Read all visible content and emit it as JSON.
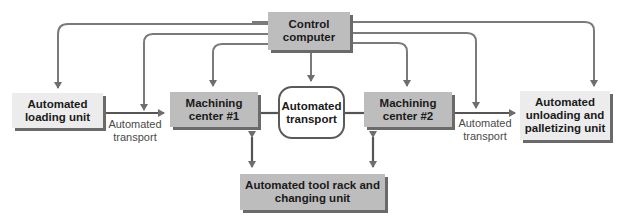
{
  "diagram": {
    "nodes": {
      "control": {
        "line1": "Control",
        "line2": "computer"
      },
      "loading": {
        "line1": "Automated",
        "line2": "loading unit"
      },
      "mc1": {
        "line1": "Machining",
        "line2": "center #1"
      },
      "transport_loop": {
        "line1": "Automated",
        "line2": "transport"
      },
      "mc2": {
        "line1": "Machining",
        "line2": "center #2"
      },
      "unloading": {
        "line1": "Automated",
        "line2": "unloading and",
        "line3": "palletizing unit"
      },
      "toolrack": {
        "line1": "Automated tool rack and",
        "line2": "changing unit"
      }
    },
    "edge_labels": {
      "left_transport": {
        "line1": "Automated",
        "line2": "transport"
      },
      "right_transport": {
        "line1": "Automated",
        "line2": "transport"
      }
    },
    "colors": {
      "line": "#6e6e6e",
      "dark_box": "#bdbdbd",
      "light_box": "#ececec"
    }
  }
}
